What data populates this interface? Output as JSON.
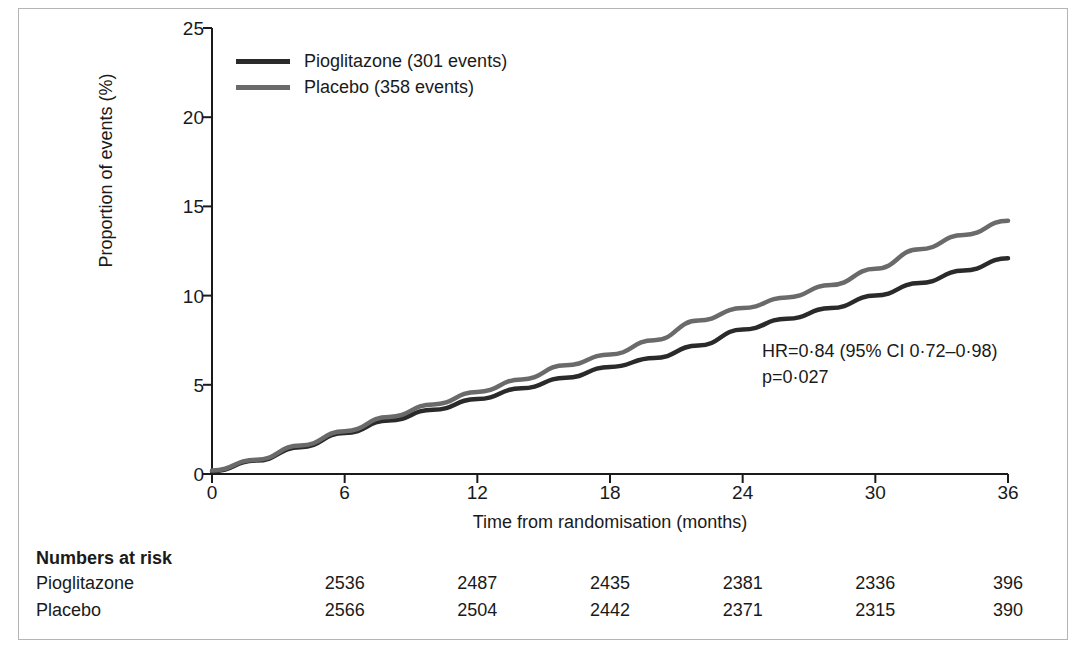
{
  "figure": {
    "legend": [
      {
        "key": "pioglitazone",
        "label": "Pioglitazone (301 events)",
        "color": "#2a2a2a"
      },
      {
        "key": "placebo",
        "label": "Placebo (358 events)",
        "color": "#6a6a6a"
      }
    ],
    "stats": {
      "hazard_ratio": "HR=0·84 (95% CI 0·72–0·98)",
      "p_value": "p=0·027"
    },
    "risk_table": {
      "title": "Numbers at risk",
      "columns": [
        6,
        12,
        18,
        24,
        30,
        36
      ],
      "rows": [
        {
          "label": "Pioglitazone",
          "values": [
            "2536",
            "2487",
            "2435",
            "2381",
            "2336",
            "396"
          ]
        },
        {
          "label": "Placebo",
          "values": [
            "2566",
            "2504",
            "2442",
            "2371",
            "2315",
            "390"
          ]
        }
      ]
    }
  },
  "chart_data": {
    "type": "line",
    "title": "",
    "xlabel": "Time from randomisation (months)",
    "ylabel": "Proportion of events (%)",
    "xlim": [
      0,
      36
    ],
    "ylim": [
      0,
      25
    ],
    "xticks": [
      0,
      6,
      12,
      18,
      24,
      30,
      36
    ],
    "yticks": [
      0,
      5,
      10,
      15,
      20,
      25
    ],
    "grid": false,
    "legend_position": "top-left",
    "annotations": [
      "HR=0·84 (95% CI 0·72–0·98)",
      "p=0·027"
    ],
    "x": [
      0,
      2,
      4,
      6,
      8,
      10,
      12,
      14,
      16,
      18,
      20,
      22,
      24,
      26,
      28,
      30,
      32,
      34,
      36
    ],
    "series": [
      {
        "name": "Pioglitazone (301 events)",
        "color": "#2a2a2a",
        "events": 301,
        "values": [
          0.15,
          0.75,
          1.5,
          2.3,
          3.0,
          3.6,
          4.2,
          4.8,
          5.4,
          6.0,
          6.5,
          7.2,
          8.1,
          8.7,
          9.3,
          10.0,
          10.7,
          11.4,
          12.1
        ]
      },
      {
        "name": "Placebo (358 events)",
        "color": "#6a6a6a",
        "events": 358,
        "values": [
          0.2,
          0.8,
          1.6,
          2.4,
          3.2,
          3.9,
          4.6,
          5.3,
          6.1,
          6.7,
          7.5,
          8.6,
          9.3,
          9.9,
          10.6,
          11.5,
          12.6,
          13.4,
          14.2
        ]
      }
    ]
  }
}
